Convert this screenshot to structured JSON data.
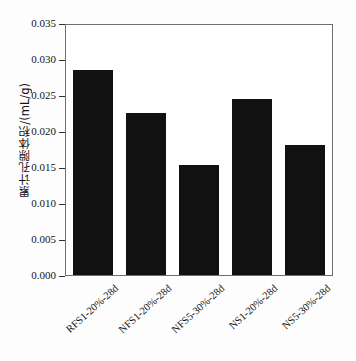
{
  "chart_data": {
    "type": "bar",
    "title": "",
    "xlabel": "",
    "ylabel": "累计孔隙体积/(mL/g)",
    "categories": [
      "RFS1-20%-28d",
      "NFS1-20%-28d",
      "NFS5-30%-28d",
      "NS1-20%-28d",
      "NS5-30%-28d"
    ],
    "values": [
      0.0288,
      0.0228,
      0.0156,
      0.0247,
      0.0183
    ],
    "ylim": [
      0.0,
      0.035
    ],
    "ytick_values": [
      0.0,
      0.005,
      0.01,
      0.015,
      0.02,
      0.025,
      0.03,
      0.035
    ],
    "ytick_labels": [
      "0.000",
      "0.005",
      "0.010",
      "0.015",
      "0.020",
      "0.025",
      "0.030",
      "0.035"
    ],
    "grid": false,
    "legend": null,
    "bar_color": "#111111",
    "frame_color": "#6e6e6e"
  }
}
